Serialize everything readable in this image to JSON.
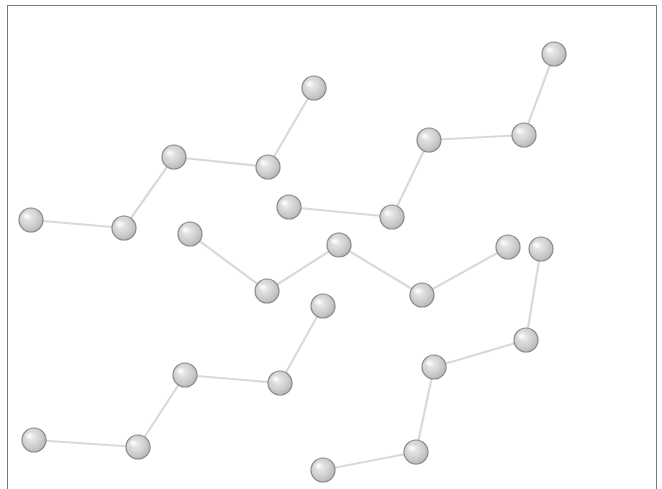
{
  "diagram": {
    "frame": {
      "x": 7,
      "y": 5,
      "width": 650,
      "border_color": "#7a7a7a",
      "bottom_border": false
    },
    "style": {
      "background": "#ffffff",
      "edge_color": "#d9d9d9",
      "node_fill": "#cfcfcf",
      "node_stroke": "#8a8a8a",
      "node_highlight": "#ffffff",
      "node_radius": 12
    },
    "chains": [
      {
        "name": "chain-1",
        "nodes": [
          [
            31,
            220
          ],
          [
            124,
            228
          ],
          [
            174,
            157
          ],
          [
            268,
            167
          ],
          [
            314,
            88
          ]
        ]
      },
      {
        "name": "chain-2",
        "nodes": [
          [
            289,
            207
          ],
          [
            392,
            217
          ],
          [
            429,
            140
          ],
          [
            524,
            135
          ],
          [
            554,
            54
          ]
        ]
      },
      {
        "name": "chain-3",
        "nodes": [
          [
            190,
            234
          ],
          [
            267,
            291
          ],
          [
            339,
            245
          ],
          [
            422,
            295
          ],
          [
            508,
            247
          ]
        ]
      },
      {
        "name": "chain-4",
        "nodes": [
          [
            34,
            440
          ],
          [
            138,
            447
          ],
          [
            185,
            375
          ],
          [
            280,
            383
          ],
          [
            323,
            306
          ]
        ]
      },
      {
        "name": "chain-5",
        "nodes": [
          [
            323,
            470
          ],
          [
            416,
            452
          ],
          [
            434,
            367
          ],
          [
            526,
            340
          ],
          [
            541,
            249
          ]
        ]
      }
    ]
  }
}
